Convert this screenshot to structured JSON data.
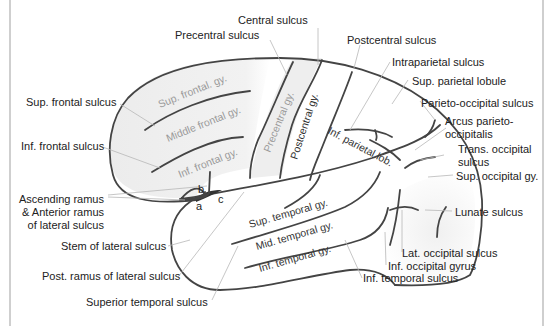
{
  "figure": {
    "colors": {
      "outline": "#444444",
      "leader_line": "#b8b8b8",
      "label_text": "#222222",
      "gyrus_text": "#9a9a9a",
      "frontal_shade": "#eeeeee",
      "occipital_shade": "#f1f1f1"
    },
    "labels": {
      "central_sulcus": "Central sulcus",
      "precentral_sulcus": "Precentral sulcus",
      "postcentral_sulcus": "Postcentral sulcus",
      "intraparietal_sulcus": "Intraparietal sulcus",
      "sup_parietal_lobule": "Sup. parietal lobule",
      "parieto_occipital_sulcus": "Parieto-occipital sulcus",
      "arcus_line1": "Arcus parieto-",
      "arcus_line2": "occipitalis",
      "trans_occipital_line1": "Trans. occipital",
      "trans_occipital_line2": "sulcus",
      "sup_occipital_gy": "Sup. occipital gy.",
      "lunate_sulcus": "Lunate sulcus",
      "lat_occipital_sulcus": "Lat. occipital sulcus",
      "inf_occipital_gyrus": "Inf. occipital gyrus",
      "inf_temporal_sulcus": "Inf. temporal sulcus",
      "superior_temporal_sulcus": "Superior temporal sulcus",
      "post_ramus": "Post. ramus of lateral sulcus",
      "stem_lateral": "Stem of lateral sulcus",
      "ascending_line1": "Ascending ramus",
      "ascending_line2": "& Anterior ramus",
      "ascending_line3": "of lateral sulcus",
      "inf_frontal_sulcus": "Inf. frontal sulcus",
      "sup_frontal_sulcus": "Sup. frontal sulcus"
    },
    "gyri": {
      "sup_frontal": "Sup. frontal. gy.",
      "middle_frontal": "Middle frontal gy.",
      "inf_frontal": "Inf. frontal gy.",
      "precentral": "Precentral gy.",
      "postcentral": "Postcentral gy.",
      "inf_parietal": "Inf. parietal lob.",
      "sup_temporal": "Sup. temporal gy.",
      "mid_temporal": "Mid. temporal gy.",
      "inf_temporal": "Inf. temporal gy."
    },
    "letters": {
      "a": "a",
      "b": "b",
      "c": "c"
    }
  }
}
